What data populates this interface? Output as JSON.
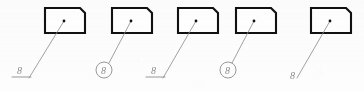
{
  "drawing": {
    "title": "Leader line and item-number annotation variants",
    "background_color": "#fdfdfd",
    "outline_color": "#111111",
    "outline_width": 2.1,
    "leader_color": "#8a8a8a",
    "leader_width": 0.8,
    "label_color": "#8d8d8d",
    "label_font_size": 10,
    "dot_color": "#111111",
    "dot_radius": 1.4
  },
  "shapes": [
    {
      "name": "part-1",
      "kind": "chamfered-rectangle",
      "x": 45,
      "y": 8,
      "width": 40,
      "height": 25,
      "chamfer": 5,
      "chamfer_corner": "top-right"
    },
    {
      "name": "part-2",
      "kind": "chamfered-rectangle",
      "x": 112,
      "y": 8,
      "width": 40,
      "height": 25,
      "chamfer": 5,
      "chamfer_corner": "top-right"
    },
    {
      "name": "part-3",
      "kind": "chamfered-rectangle",
      "x": 178,
      "y": 8,
      "width": 40,
      "height": 25,
      "chamfer": 5,
      "chamfer_corner": "top-right"
    },
    {
      "name": "part-4",
      "kind": "chamfered-rectangle",
      "x": 236,
      "y": 8,
      "width": 40,
      "height": 25,
      "chamfer": 5,
      "chamfer_corner": "top-right"
    },
    {
      "name": "part-5",
      "kind": "chamfered-rectangle",
      "x": 311,
      "y": 8,
      "width": 40,
      "height": 25,
      "chamfer": 5,
      "chamfer_corner": "top-right"
    }
  ],
  "callouts": [
    {
      "id": "callout-1",
      "text": "8",
      "style": "underlined",
      "dot": {
        "x": 64,
        "y": 21
      },
      "leader_end": {
        "x": 29,
        "y": 78
      },
      "label": {
        "x": 17,
        "y": 74
      },
      "underline": {
        "x1": 12,
        "y1": 77,
        "x2": 31,
        "y2": 77
      },
      "circle": null
    },
    {
      "id": "callout-2",
      "text": "8",
      "style": "circled",
      "dot": {
        "x": 131,
        "y": 21
      },
      "leader_end": {
        "x": 109,
        "y": 63
      },
      "label": {
        "x": 101,
        "y": 74
      },
      "underline": null,
      "circle": {
        "cx": 104,
        "cy": 70,
        "r": 8
      }
    },
    {
      "id": "callout-3",
      "text": "8",
      "style": "underlined",
      "dot": {
        "x": 196,
        "y": 21
      },
      "leader_end": {
        "x": 163,
        "y": 78
      },
      "label": {
        "x": 151,
        "y": 74
      },
      "underline": {
        "x1": 146,
        "y1": 77,
        "x2": 165,
        "y2": 77
      },
      "circle": null
    },
    {
      "id": "callout-4",
      "text": "8",
      "style": "circled",
      "dot": {
        "x": 254,
        "y": 21
      },
      "leader_end": {
        "x": 232,
        "y": 63
      },
      "label": {
        "x": 225,
        "y": 74
      },
      "underline": null,
      "circle": {
        "cx": 228,
        "cy": 70,
        "r": 8
      }
    },
    {
      "id": "callout-5",
      "text": "8",
      "style": "plain",
      "dot": {
        "x": 330,
        "y": 21
      },
      "leader_end": {
        "x": 297,
        "y": 78
      },
      "label": {
        "x": 290,
        "y": 79
      },
      "underline": null,
      "circle": null
    }
  ]
}
